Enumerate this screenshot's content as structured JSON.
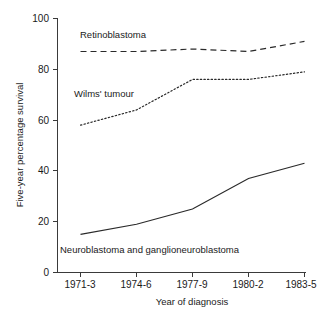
{
  "chart_data": {
    "type": "line",
    "title": "",
    "xlabel": "Year of diagnosis",
    "ylabel": "Five-year percentage survival",
    "categories": [
      "1971-3",
      "1974-6",
      "1977-9",
      "1980-2",
      "1983-5"
    ],
    "ylim": [
      0,
      100
    ],
    "yticks": [
      0,
      20,
      40,
      60,
      80,
      100
    ],
    "ytick_labels": [
      "0",
      "20",
      "40",
      "60",
      "80",
      "100"
    ],
    "grid": false,
    "legend_position": "inline-annotations",
    "series": [
      {
        "name": "Retinoblastoma",
        "style": "dashed",
        "color": "#2a2a2a",
        "values": [
          87,
          87,
          88,
          87,
          91
        ]
      },
      {
        "name": "Wilms' tumour",
        "style": "dotted",
        "color": "#2a2a2a",
        "values": [
          58,
          64,
          76,
          76,
          79
        ]
      },
      {
        "name": "Neuroblastoma and ganglioneuroblastoma",
        "style": "solid",
        "color": "#2a2a2a",
        "values": [
          15,
          19,
          25,
          37,
          43
        ]
      }
    ],
    "annotations": [
      {
        "text": "Retinoblastoma",
        "x_px": 80,
        "y_px": 38
      },
      {
        "text": "Wilms' tumour",
        "x_px": 74,
        "y_px": 97
      },
      {
        "text": "Neuroblastoma and ganglioneuroblastoma",
        "x_px": 60,
        "y_px": 253
      }
    ]
  },
  "axis": {
    "y_title": "Five-year percentage survival",
    "x_title": "Year of diagnosis",
    "y_labels": [
      "100",
      "80",
      "60",
      "40",
      "20",
      "0"
    ],
    "x_labels": [
      "1971-3",
      "1974-6",
      "1977-9",
      "1980-2",
      "1983-5"
    ]
  }
}
